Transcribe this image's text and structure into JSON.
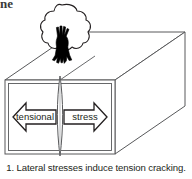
{
  "page": {
    "heading_fragment": "ne",
    "background_color": "#ffffff",
    "ink_color": "#231f20",
    "line_color": "#58595b"
  },
  "figure": {
    "caption": "1. Lateral stresses induce tension cracking.",
    "caption_number": "1.",
    "caption_text": "Lateral stresses induce tension cracking.",
    "alt_summary": "A 3D block of soil with a tree on top, split by a vertical tension crack, with opposing horizontal arrows labeled tensional and stress."
  },
  "diagram": {
    "block": {
      "name": "soil-block",
      "front_face": {
        "x": 5,
        "y": 80,
        "width": 110,
        "height": 74
      },
      "depth_offset_x": 70,
      "depth_offset_y": -48,
      "stroke": "#58595b",
      "stroke_width": 1
    },
    "crack": {
      "name": "tension-crack",
      "center_x": 60,
      "top_y": 76,
      "bottom_y": 156,
      "max_half_width": 3.2,
      "stroke": "#58595b"
    },
    "tree": {
      "name": "tree",
      "canopy_center_x": 62,
      "canopy_center_y": 28,
      "trunk_color": "#000000",
      "canopy_stroke": "#231f20"
    },
    "arrows": [
      {
        "name": "arrow-tensional",
        "label": "tensional",
        "direction": "left",
        "fill": "#ffffff",
        "stroke": "#231f20"
      },
      {
        "name": "arrow-stress",
        "label": "stress",
        "direction": "right",
        "fill": "#ffffff",
        "stroke": "#231f20"
      }
    ]
  }
}
